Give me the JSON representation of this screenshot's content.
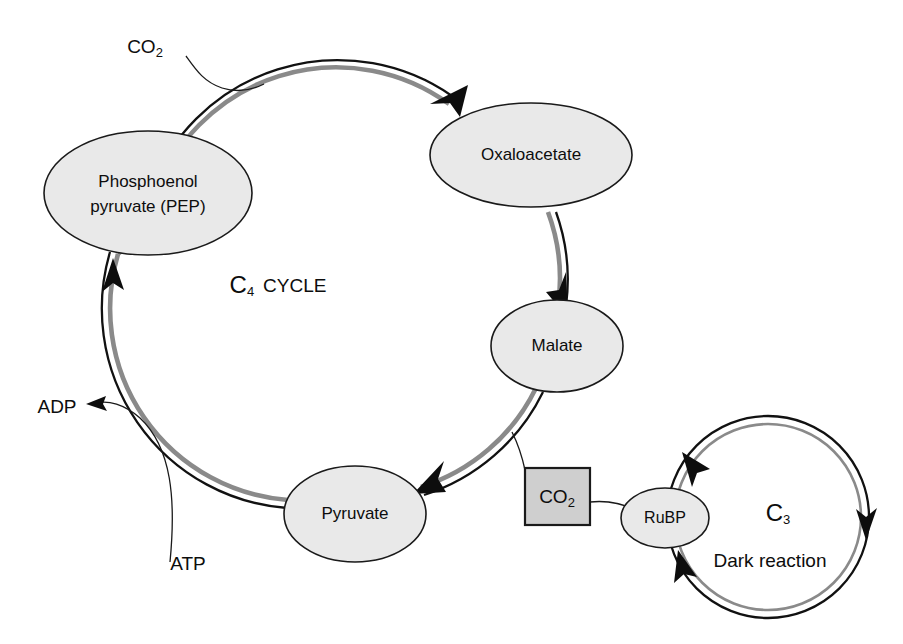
{
  "figure": {
    "type": "biology-pathway-diagram",
    "background_color": "#ffffff",
    "node_fill_color": "#e9e9e9",
    "box_fill_color": "#cfcfcf",
    "outline_color": "#1a1a1a",
    "ring_outer_color": "#111111",
    "ring_inner_color": "#8a8a8a"
  },
  "c4_cycle": {
    "title_c": "C",
    "title_sub": "4",
    "title_word": "CYCLE",
    "nodes": [
      {
        "id": "pep",
        "label_line1": "Phosphoenol",
        "label_line2": "pyruvate (PEP)"
      },
      {
        "id": "oxaloacetate",
        "label": "Oxaloacetate"
      },
      {
        "id": "malate",
        "label": "Malate"
      },
      {
        "id": "pyruvate",
        "label": "Pyruvate"
      }
    ],
    "inputs": [
      {
        "id": "co2_in",
        "label_main": "CO",
        "label_sub": "2"
      },
      {
        "id": "atp",
        "label": "ATP"
      }
    ],
    "outputs": [
      {
        "id": "adp",
        "label": "ADP"
      }
    ]
  },
  "co2_box": {
    "label_main": "CO",
    "label_sub": "2"
  },
  "c3_cycle": {
    "title_c": "C",
    "title_sub": "3",
    "caption": "Dark reaction",
    "nodes": [
      {
        "id": "rubp",
        "label": "RuBP"
      }
    ]
  }
}
